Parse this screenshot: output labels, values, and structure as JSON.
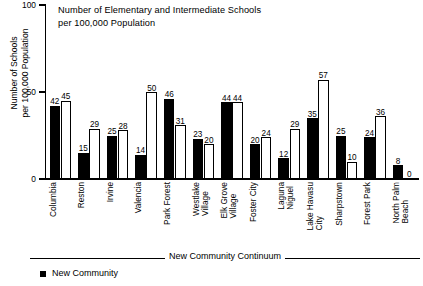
{
  "chart_data": {
    "type": "bar",
    "title": "Number of Elementary and Intermediate Schools\nper 100,000 Population",
    "xlabel": "New Community Continuum",
    "ylabel": "Number of Schools\nper 100,000 Population",
    "ylim": [
      0,
      100
    ],
    "yticks": [
      0,
      50,
      100
    ],
    "ytick_labels": [
      "0",
      "50",
      "100"
    ],
    "grid": false,
    "legend_position": "bottom-left",
    "categories": [
      "Columbia",
      "Reston",
      "Irvine",
      "Valencia",
      "Park Forest",
      "Westlake\nVillage",
      "Elk Grove\nVillage",
      "Foster City",
      "Laguna\nNiguel",
      "Lake Havasu\nCity",
      "Sharpstown",
      "Forest Park",
      "North Palm\nBeach"
    ],
    "series": [
      {
        "name": "New Community",
        "color": "#000000",
        "style": "filled",
        "values": [
          42,
          15,
          25,
          14,
          46,
          23,
          44,
          20,
          12,
          35,
          25,
          24,
          8
        ]
      },
      {
        "name": "Paired Conventional Community",
        "color": "#ffffff",
        "style": "outlined",
        "values": [
          45,
          29,
          28,
          50,
          31,
          20,
          44,
          24,
          29,
          57,
          10,
          36,
          0
        ]
      }
    ]
  },
  "legend": {
    "entries": [
      {
        "label": "New Community",
        "marker": "filled-square"
      }
    ]
  }
}
